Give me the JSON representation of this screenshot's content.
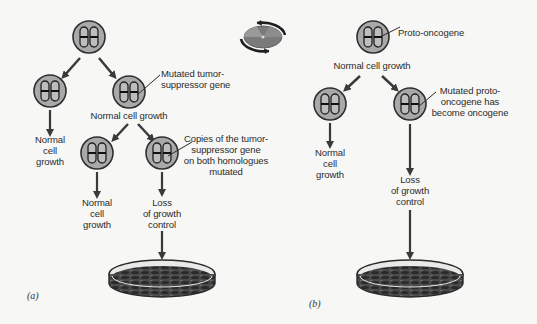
{
  "figure": {
    "panel_a": {
      "letter": "(a)",
      "root_cell": {
        "state": "normal"
      },
      "left_branch": {
        "label_line1": "Normal",
        "label_line2": "cell",
        "label_line3": "growth"
      },
      "mutated_cell_callout": {
        "line1": "Mutated tumor-",
        "line2": "suppressor gene"
      },
      "mutated_cell_caption": "Normal cell growth",
      "sub_left": {
        "label_line1": "Normal",
        "label_line2": "cell",
        "label_line3": "growth"
      },
      "double_mutation_callout": {
        "line1": "Copies of the tumor-",
        "line2": "suppressor gene",
        "line3": "on both homologues",
        "line4": "mutated"
      },
      "outcome": {
        "line1": "Loss",
        "line2": "of growth",
        "line3": "control"
      }
    },
    "panel_b": {
      "letter": "(b)",
      "root_callout": "Proto-oncogene",
      "root_caption": "Normal cell growth",
      "left_branch": {
        "label_line1": "Normal",
        "label_line2": "cell",
        "label_line3": "growth"
      },
      "mutated_callout": {
        "line1": "Mutated proto-",
        "line2": "oncogene has",
        "line3": "become oncogene"
      },
      "outcome": {
        "line1": "Loss",
        "line2": "of growth",
        "line3": "control"
      }
    },
    "colors": {
      "cell_fill": "#a9a9a9",
      "cell_stroke": "#2f2f2f",
      "arrow": "#3a3a3a",
      "dish_fill": "#3c3c3c",
      "background": "#f7f7f5"
    }
  }
}
